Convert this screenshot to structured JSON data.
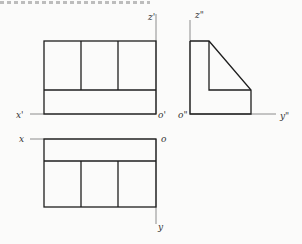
{
  "figure": {
    "top_caption_clipped": true,
    "views": [
      {
        "name": "front-view",
        "cells_top_row": 3,
        "has_bottom_band": true
      },
      {
        "name": "side-view",
        "shape": "L-profile with sloped face"
      },
      {
        "name": "top-view",
        "cells_bottom_row": 3,
        "has_top_band": true
      }
    ],
    "labels": {
      "z_prime": "z'",
      "z_double": "z\"",
      "x_prime": "x'",
      "o_prime": "o'",
      "o_double": "o\"",
      "y_double": "y\"",
      "x": "x",
      "o": "o",
      "y": "y"
    },
    "colors": {
      "edge": "#1e1e1e",
      "axis": "#8c8c8c",
      "background": "#fbfbfa"
    }
  }
}
